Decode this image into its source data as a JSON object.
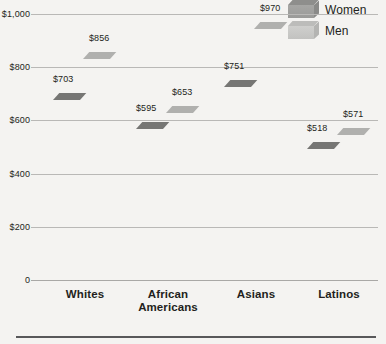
{
  "chart_data": {
    "type": "bar",
    "title": "",
    "subtitle": "",
    "xlabel": "",
    "ylabel": "",
    "categories": [
      "Whites",
      "African Americans",
      "Asians",
      "Latinos"
    ],
    "category_lines": [
      [
        "Whites"
      ],
      [
        "African",
        "Americans"
      ],
      [
        "Asians"
      ],
      [
        "Latinos"
      ]
    ],
    "series": [
      {
        "name": "Women",
        "color": "#a0a09e",
        "values": [
          703,
          595,
          751,
          518
        ]
      },
      {
        "name": "Men",
        "color": "#c8c8c6",
        "values": [
          856,
          653,
          970,
          571
        ]
      }
    ],
    "value_labels": [
      [
        "$703",
        "$856"
      ],
      [
        "$595",
        "$653"
      ],
      [
        "$751",
        "$970"
      ],
      [
        "$518",
        "$571"
      ]
    ],
    "ylim": [
      0,
      1000
    ],
    "yticks": [
      0,
      200,
      400,
      600,
      800,
      1000
    ],
    "ytick_labels": [
      "0",
      "$200",
      "$400",
      "$600",
      "$800",
      "$1,000"
    ],
    "grid": true,
    "legend_position": "top-right"
  },
  "legend": {
    "items": [
      {
        "label": "Women",
        "swatch": "bar-swatch-women"
      },
      {
        "label": "Men",
        "swatch": "bar-swatch-men"
      }
    ]
  }
}
